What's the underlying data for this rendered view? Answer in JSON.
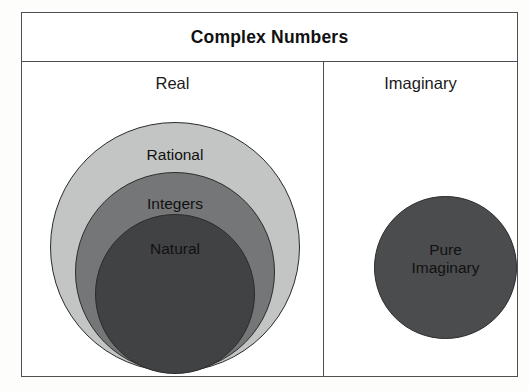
{
  "diagram": {
    "title": "Complex Numbers",
    "panels": [
      {
        "id": "real",
        "label": "Real",
        "sets": [
          {
            "id": "rational",
            "label": "Rational",
            "color": "#c3c4c4"
          },
          {
            "id": "integers",
            "label": "Integers",
            "color": "#757677"
          },
          {
            "id": "natural",
            "label": "Natural",
            "color": "#414244"
          }
        ]
      },
      {
        "id": "imaginary",
        "label": "Imaginary",
        "sets": [
          {
            "id": "pure-imaginary",
            "label_line1": "Pure",
            "label_line2": "Imaginary",
            "color": "#4b4c4e"
          }
        ]
      }
    ],
    "colors": {
      "frame_border": "#4d4f52",
      "circle_outline": "#2b2b2b",
      "background": "#ffffff",
      "text": "#111111"
    }
  }
}
